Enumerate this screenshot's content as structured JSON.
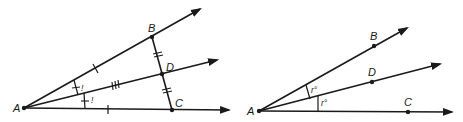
{
  "figures": [
    {
      "id": "left",
      "points": {
        "A": {
          "label": "A"
        },
        "B": {
          "label": "B"
        },
        "C": {
          "label": "C"
        },
        "D": {
          "label": "D"
        }
      },
      "marks": {
        "angle_mark_upper": "!",
        "angle_mark_lower": "!"
      }
    },
    {
      "id": "right",
      "points": {
        "A": {
          "label": "A"
        },
        "B": {
          "label": "B"
        },
        "C": {
          "label": "C"
        },
        "D": {
          "label": "D"
        }
      },
      "angles": {
        "upper": "r°",
        "lower": "r°"
      }
    }
  ],
  "colors": {
    "line": "#1a1a1a",
    "background": "#ffffff"
  }
}
